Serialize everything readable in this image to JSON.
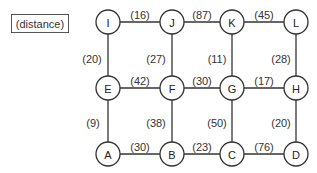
{
  "legend": {
    "label": "(distance)"
  },
  "nodes": [
    {
      "id": "I",
      "x": 108,
      "y": 22
    },
    {
      "id": "J",
      "x": 172,
      "y": 22
    },
    {
      "id": "K",
      "x": 232,
      "y": 22
    },
    {
      "id": "L",
      "x": 296,
      "y": 22
    },
    {
      "id": "E",
      "x": 108,
      "y": 88
    },
    {
      "id": "F",
      "x": 172,
      "y": 88
    },
    {
      "id": "G",
      "x": 232,
      "y": 88
    },
    {
      "id": "H",
      "x": 296,
      "y": 88
    },
    {
      "id": "A",
      "x": 108,
      "y": 154
    },
    {
      "id": "B",
      "x": 172,
      "y": 154
    },
    {
      "id": "C",
      "x": 232,
      "y": 154
    },
    {
      "id": "D",
      "x": 296,
      "y": 154
    }
  ],
  "edges": [
    {
      "from": "I",
      "to": "J",
      "label": "(16)",
      "lx": 140,
      "ly": 15
    },
    {
      "from": "J",
      "to": "K",
      "label": "(87)",
      "lx": 202,
      "ly": 15
    },
    {
      "from": "K",
      "to": "L",
      "label": "(45)",
      "lx": 264,
      "ly": 15
    },
    {
      "from": "I",
      "to": "E",
      "label": "(20)",
      "lx": 92,
      "ly": 59
    },
    {
      "from": "J",
      "to": "F",
      "label": "(27)",
      "lx": 156,
      "ly": 59
    },
    {
      "from": "K",
      "to": "G",
      "label": "(11)",
      "lx": 217,
      "ly": 59
    },
    {
      "from": "L",
      "to": "H",
      "label": "(28)",
      "lx": 281,
      "ly": 59
    },
    {
      "from": "E",
      "to": "F",
      "label": "(42)",
      "lx": 140,
      "ly": 81
    },
    {
      "from": "F",
      "to": "G",
      "label": "(30)",
      "lx": 202,
      "ly": 81
    },
    {
      "from": "G",
      "to": "H",
      "label": "(17)",
      "lx": 264,
      "ly": 81
    },
    {
      "from": "E",
      "to": "A",
      "label": "(9)",
      "lx": 93,
      "ly": 123
    },
    {
      "from": "F",
      "to": "B",
      "label": "(38)",
      "lx": 156,
      "ly": 123
    },
    {
      "from": "G",
      "to": "C",
      "label": "(50)",
      "lx": 217,
      "ly": 123
    },
    {
      "from": "H",
      "to": "D",
      "label": "(20)",
      "lx": 281,
      "ly": 123
    },
    {
      "from": "A",
      "to": "B",
      "label": "(30)",
      "lx": 140,
      "ly": 147
    },
    {
      "from": "B",
      "to": "C",
      "label": "(23)",
      "lx": 202,
      "ly": 147
    },
    {
      "from": "C",
      "to": "D",
      "label": "(76)",
      "lx": 264,
      "ly": 147
    }
  ],
  "node_radius": 12
}
